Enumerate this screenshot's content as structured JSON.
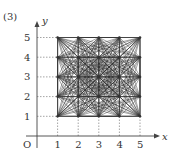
{
  "problem_label": "(3)",
  "axes": {
    "x_label": "x",
    "y_label": "y",
    "origin_label": "O",
    "x_ticks": [
      "1",
      "2",
      "3",
      "4",
      "5"
    ],
    "y_ticks": [
      "1",
      "2",
      "3",
      "4",
      "5"
    ]
  },
  "grid": {
    "min": 1,
    "max": 5,
    "description": "All lattice points (i,j) with 1<=i,j<=5 joined pairwise by line segments"
  },
  "colors": {
    "line": "#333333",
    "dashed": "#666666"
  }
}
